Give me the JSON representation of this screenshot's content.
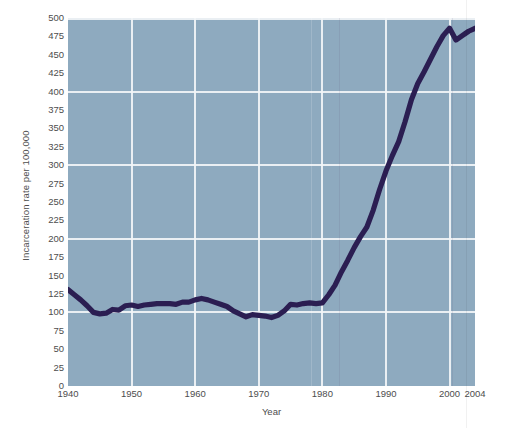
{
  "chart_data": {
    "type": "line",
    "title": "",
    "xlabel": "Year",
    "ylabel": "Incarceration rate per 100,000",
    "xlim": [
      1940,
      2004
    ],
    "ylim": [
      0,
      500
    ],
    "grid": true,
    "legend": "none",
    "plot_background_color": "#8eaabf",
    "line_color": "#2b1e52",
    "gridline_color": "#f2f5f7",
    "x_ticks": [
      1940,
      1950,
      1960,
      1970,
      1980,
      1990,
      2000,
      2004
    ],
    "x_tick_labels": [
      "1940",
      "1950",
      "1960",
      "1970",
      "1980",
      "1990",
      "2000",
      "2004"
    ],
    "y_ticks": [
      0,
      25,
      50,
      75,
      100,
      125,
      150,
      175,
      200,
      225,
      250,
      275,
      300,
      325,
      350,
      375,
      400,
      425,
      450,
      475,
      500
    ],
    "y_tick_labels": [
      "0",
      "25",
      "50",
      "75",
      "100",
      "125",
      "150",
      "175",
      "200",
      "225",
      "250",
      "275",
      "300",
      "325",
      "350",
      "375",
      "400",
      "425",
      "450",
      "475",
      "500"
    ],
    "y_gridlines": [
      100,
      200,
      300,
      400,
      500
    ],
    "x_gridlines": [
      1950,
      1960,
      1970,
      1980,
      1990,
      2000
    ],
    "series": [
      {
        "name": "Incarceration rate",
        "x": [
          1940,
          1941,
          1942,
          1943,
          1944,
          1945,
          1946,
          1947,
          1948,
          1949,
          1950,
          1951,
          1952,
          1953,
          1954,
          1955,
          1956,
          1957,
          1958,
          1959,
          1960,
          1961,
          1962,
          1963,
          1964,
          1965,
          1966,
          1967,
          1968,
          1969,
          1970,
          1971,
          1972,
          1973,
          1974,
          1975,
          1976,
          1977,
          1978,
          1979,
          1980,
          1981,
          1982,
          1983,
          1984,
          1985,
          1986,
          1987,
          1988,
          1989,
          1990,
          1991,
          1992,
          1993,
          1994,
          1995,
          1996,
          1997,
          1998,
          1999,
          2000,
          2001,
          2002,
          2003,
          2004
        ],
        "y": [
          131,
          124,
          117,
          109,
          100,
          98,
          99,
          104,
          103,
          109,
          110,
          108,
          110,
          111,
          112,
          112,
          112,
          111,
          114,
          114,
          117,
          119,
          117,
          114,
          111,
          108,
          102,
          98,
          94,
          97,
          96,
          95,
          93,
          96,
          102,
          111,
          110,
          112,
          113,
          112,
          113,
          124,
          137,
          155,
          171,
          188,
          203,
          216,
          239,
          267,
          292,
          313,
          332,
          359,
          389,
          411,
          427,
          444,
          461,
          476,
          486,
          470,
          476,
          482,
          486
        ]
      }
    ],
    "annotations": []
  }
}
